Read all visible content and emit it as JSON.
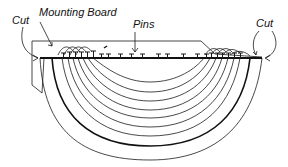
{
  "diagram": {
    "labels": {
      "cut_left": "Cut",
      "mounting_board": "Mounting Board",
      "pins": "Pins",
      "cut_right": "Cut"
    },
    "colors": {
      "ink": "#1a1a1a",
      "background": "#ffffff"
    },
    "arc_count": 9,
    "pin_count": 22
  }
}
